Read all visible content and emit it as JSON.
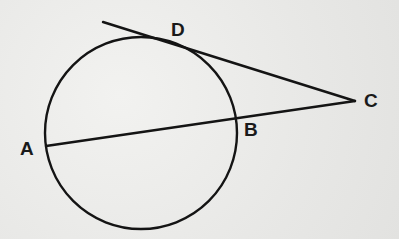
{
  "diagram": {
    "type": "geometry-circle-tangent-secant",
    "stroke_color": "#141414",
    "circle": {
      "cx": 141,
      "cy": 133,
      "r": 96
    },
    "points": [
      {
        "id": "A",
        "label": "A",
        "x": 46,
        "y": 146,
        "label_x": 20,
        "label_y": 139
      },
      {
        "id": "B",
        "label": "B",
        "x": 237,
        "y": 120,
        "label_x": 244,
        "label_y": 120
      },
      {
        "id": "C",
        "label": "C",
        "x": 355,
        "y": 101,
        "label_x": 364,
        "label_y": 91
      },
      {
        "id": "D",
        "label": "D",
        "x": 155,
        "y": 38,
        "label_x": 171,
        "label_y": 20
      }
    ],
    "segments": [
      {
        "name": "tangent-line-CD",
        "x1": 103,
        "y1": 22,
        "x2": 355,
        "y2": 101
      },
      {
        "name": "secant-line-AC",
        "x1": 46,
        "y1": 146,
        "x2": 355,
        "y2": 101
      }
    ]
  }
}
